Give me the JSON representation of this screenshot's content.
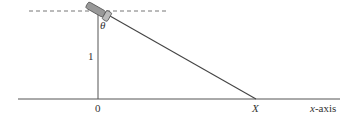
{
  "diagram": {
    "type": "geometry",
    "labels": {
      "theta": "θ",
      "height": "1",
      "origin": "0",
      "intersection": "X",
      "axis_var": "x",
      "axis_suffix": "-axis"
    },
    "colors": {
      "line": "#444444",
      "dashed": "#777777",
      "lamp_body": "#999999",
      "lamp_outline": "#555555"
    }
  }
}
